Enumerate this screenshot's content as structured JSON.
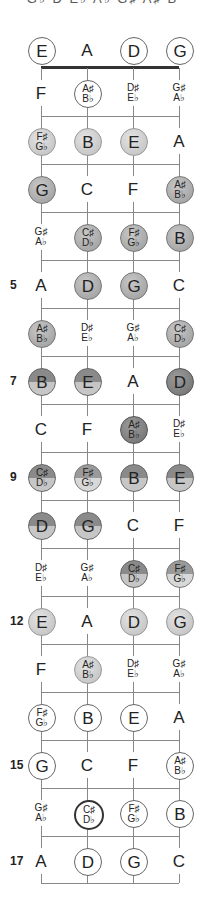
{
  "header": {
    "cropped_text": "G♭ D E♭ A♭ G♯ A♯ B"
  },
  "strings": [
    {
      "name": "E",
      "x": 41
    },
    {
      "name": "A",
      "x": 87
    },
    {
      "name": "D",
      "x": 133
    },
    {
      "name": "G",
      "x": 179
    }
  ],
  "layout": {
    "nut_y": 67,
    "fret_spacing": 48,
    "first_row_y": 93,
    "open_row_y": 50,
    "bottom_y": 883
  },
  "open_notes": [
    {
      "label": "E",
      "style": "o-open"
    },
    {
      "label": "A",
      "style": "f-none"
    },
    {
      "label": "D",
      "style": "o-open"
    },
    {
      "label": "G",
      "style": "o-open"
    }
  ],
  "fret_numbers": {
    "5": "5",
    "7": "7",
    "9": "9",
    "12": "12",
    "15": "15",
    "17": "17"
  },
  "rows": [
    {
      "fret": 1,
      "notes": [
        [
          "F",
          "f-none"
        ],
        [
          "A♯|B♭",
          "o-open"
        ],
        [
          "D♯|E♭",
          "f-none"
        ],
        [
          "G♯|A♭",
          "f-none"
        ]
      ]
    },
    {
      "fret": 2,
      "notes": [
        [
          "F♯|G♭",
          "f-light"
        ],
        [
          "B",
          "f-light"
        ],
        [
          "E",
          "f-light"
        ],
        [
          "A",
          "f-none"
        ]
      ]
    },
    {
      "fret": 3,
      "notes": [
        [
          "G",
          "f-mid"
        ],
        [
          "C",
          "f-none"
        ],
        [
          "F",
          "f-none"
        ],
        [
          "A♯|B♭",
          "f-mid"
        ]
      ]
    },
    {
      "fret": 4,
      "notes": [
        [
          "G♯|A♭",
          "f-none"
        ],
        [
          "C♯|D♭",
          "f-mid o-thick"
        ],
        [
          "F♯|G♭",
          "f-mid"
        ],
        [
          "B",
          "f-mid"
        ]
      ]
    },
    {
      "fret": 5,
      "notes": [
        [
          "A",
          "f-none"
        ],
        [
          "D",
          "f-mid"
        ],
        [
          "G",
          "f-mid"
        ],
        [
          "C",
          "f-none"
        ]
      ]
    },
    {
      "fret": 6,
      "notes": [
        [
          "A♯|B♭",
          "f-mid"
        ],
        [
          "D♯|E♭",
          "f-none"
        ],
        [
          "G♯|A♭",
          "f-none"
        ],
        [
          "C♯|D♭",
          "f-mid o-thick"
        ]
      ]
    },
    {
      "fret": 7,
      "notes": [
        [
          "B",
          "f-half"
        ],
        [
          "E",
          "f-half"
        ],
        [
          "A",
          "f-none"
        ],
        [
          "D",
          "f-dark"
        ]
      ]
    },
    {
      "fret": 8,
      "notes": [
        [
          "C",
          "f-none"
        ],
        [
          "F",
          "f-none"
        ],
        [
          "A♯|B♭",
          "f-dark"
        ],
        [
          "D♯|E♭",
          "f-none"
        ]
      ]
    },
    {
      "fret": 9,
      "notes": [
        [
          "C♯|D♭",
          "f-half o-thick"
        ],
        [
          "F♯|G♭",
          "f-half-light"
        ],
        [
          "B",
          "f-half"
        ],
        [
          "E",
          "f-half"
        ]
      ]
    },
    {
      "fret": 10,
      "notes": [
        [
          "D",
          "f-half"
        ],
        [
          "G",
          "f-half"
        ],
        [
          "C",
          "f-none"
        ],
        [
          "F",
          "f-none"
        ]
      ]
    },
    {
      "fret": 11,
      "notes": [
        [
          "D♯|E♭",
          "f-none"
        ],
        [
          "G♯|A♭",
          "f-none"
        ],
        [
          "C♯|D♭",
          "f-half o-thick"
        ],
        [
          "F♯|G♭",
          "f-half-light"
        ]
      ]
    },
    {
      "fret": 12,
      "notes": [
        [
          "E",
          "f-light"
        ],
        [
          "A",
          "f-none"
        ],
        [
          "D",
          "f-light"
        ],
        [
          "G",
          "f-light"
        ]
      ]
    },
    {
      "fret": 13,
      "notes": [
        [
          "F",
          "f-none"
        ],
        [
          "A♯|B♭",
          "f-light"
        ],
        [
          "D♯|E♭",
          "f-none"
        ],
        [
          "G♯|A♭",
          "f-none"
        ]
      ]
    },
    {
      "fret": 14,
      "notes": [
        [
          "F♯|G♭",
          "o-open"
        ],
        [
          "B",
          "o-open"
        ],
        [
          "E",
          "o-open"
        ],
        [
          "A",
          "f-none"
        ]
      ]
    },
    {
      "fret": 15,
      "notes": [
        [
          "G",
          "o-open"
        ],
        [
          "C",
          "f-none"
        ],
        [
          "F",
          "f-none"
        ],
        [
          "A♯|B♭",
          "o-open"
        ]
      ]
    },
    {
      "fret": 16,
      "notes": [
        [
          "G♯|A♭",
          "f-none"
        ],
        [
          "C♯|D♭",
          "o-thick"
        ],
        [
          "F♯|G♭",
          "o-open"
        ],
        [
          "B",
          "o-open"
        ]
      ]
    },
    {
      "fret": 17,
      "notes": [
        [
          "A",
          "f-none"
        ],
        [
          "D",
          "o-open"
        ],
        [
          "G",
          "o-open"
        ],
        [
          "C",
          "f-none"
        ]
      ]
    }
  ]
}
